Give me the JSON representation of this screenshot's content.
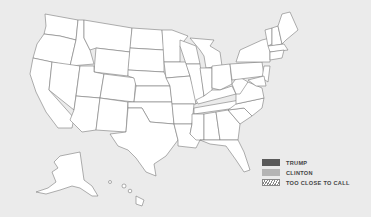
{
  "map": {
    "title": "",
    "region": "United States",
    "default_state_fill": "#ffffff",
    "border_color": "#7a7a7a",
    "background": "#ebebeb"
  },
  "legend": {
    "items": [
      {
        "label": "TRUMP",
        "color": "#5a5a5a",
        "pattern": "solid"
      },
      {
        "label": "CLINTON",
        "color": "#b4b4b4",
        "pattern": "solid"
      },
      {
        "label": "TOO CLOSE TO CALL",
        "color": "#ffffff",
        "pattern": "hatched"
      }
    ]
  }
}
